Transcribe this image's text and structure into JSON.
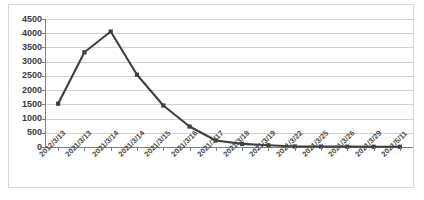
{
  "chart_data": {
    "type": "line",
    "title": "",
    "subtitle": "",
    "xlabel": "",
    "ylabel": "",
    "categories": [
      "2012/3/13",
      "2021/3/13",
      "2021/3/14",
      "2021/3/14",
      "2021/3/15",
      "2021/3/16",
      "2021/3/17",
      "2021/3/18",
      "2021/3/19",
      "2021/3/22",
      "2021/3/25",
      "2021/3/26",
      "2021/3/29",
      "2021/5/11"
    ],
    "values": [
      1520,
      3330,
      4060,
      2540,
      1460,
      720,
      230,
      110,
      60,
      20,
      15,
      12,
      10,
      8
    ],
    "ylim": [
      0,
      4500
    ],
    "ytick_values": [
      0,
      500,
      1000,
      1500,
      2000,
      2500,
      3000,
      3500,
      4000,
      4500
    ],
    "ytick_labels": [
      "0",
      "500",
      "1000",
      "1500",
      "2000",
      "2500",
      "3000",
      "3500",
      "4000",
      "4500"
    ],
    "grid": true,
    "grid_axis": "y",
    "legend": false,
    "legend_position": "none",
    "series": [
      {
        "name": "series-1",
        "values": [
          1520,
          3330,
          4060,
          2540,
          1460,
          720,
          230,
          110,
          60,
          20,
          15,
          12,
          10,
          8
        ]
      }
    ],
    "xtick_rotation": -45,
    "colors": {
      "line": "#3f3f3f",
      "marker": "#3f3f3f",
      "gridline": "#d0d0d0",
      "axis": "#808080",
      "background": "#ffffff",
      "border": "#d8d8d8",
      "tick_label": "#3c3c3c"
    }
  }
}
